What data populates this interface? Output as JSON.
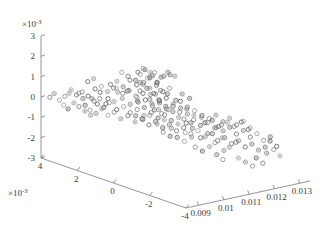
{
  "chart_data": {
    "type": "scatter",
    "title": "",
    "subtitle": "",
    "xlabel": "",
    "ylabel": "",
    "zlabel": "",
    "projection": "3d",
    "grid": false,
    "legend": null,
    "marker": {
      "shape": "circle",
      "filled": false,
      "size_px": 4.2,
      "edge_color": "#6e6e6e",
      "inner_dot_color": "#8c8c8c"
    },
    "axes": {
      "x": {
        "label": "",
        "exponent_label": "",
        "ticks": [
          0.009,
          0.01,
          0.011,
          0.012,
          0.013
        ],
        "tick_labels": [
          "0.009",
          "0.01",
          "0.011",
          "0.012",
          "0.013"
        ],
        "lim": [
          0.0085,
          0.0134
        ]
      },
      "y": {
        "label": "",
        "exponent_label": "×10",
        "exponent_value": "-3",
        "ticks": [
          4,
          2,
          0,
          -2,
          -4
        ],
        "tick_labels": [
          "4",
          "2",
          "0",
          "-2",
          "-4"
        ],
        "lim": [
          -4,
          4
        ],
        "scale_factor": 0.001
      },
      "z": {
        "label": "",
        "exponent_label": "×10",
        "exponent_value": "-3",
        "ticks": [
          3,
          2,
          1,
          0,
          -1,
          -2,
          -3
        ],
        "tick_labels": [
          "3",
          "2",
          "1",
          "0",
          "-1",
          "-2",
          "-3"
        ],
        "lim": [
          -3,
          3
        ],
        "scale_factor": 0.001
      }
    },
    "points": [
      [
        0.01058,
        1.42,
        0.95
      ],
      [
        0.01072,
        1.1,
        1.28
      ],
      [
        0.01085,
        0.88,
        1.05
      ],
      [
        0.01102,
        1.35,
        1.18
      ],
      [
        0.01118,
        0.62,
        1.4
      ],
      [
        0.01045,
        0.4,
        0.72
      ],
      [
        0.00996,
        1.8,
        0.52
      ],
      [
        0.01015,
        1.55,
        0.6
      ],
      [
        0.0103,
        1.22,
        0.35
      ],
      [
        0.01064,
        0.95,
        0.48
      ],
      [
        0.0108,
        0.7,
        0.25
      ],
      [
        0.01095,
        0.45,
        0.58
      ],
      [
        0.0111,
        0.2,
        0.3
      ],
      [
        0.01125,
        0.05,
        0.62
      ],
      [
        0.0114,
        -0.15,
        0.42
      ],
      [
        0.00962,
        2.3,
        0.45
      ],
      [
        0.00975,
        2.05,
        0.18
      ],
      [
        0.00988,
        1.9,
        0.05
      ],
      [
        0.01005,
        1.68,
        0.22
      ],
      [
        0.01022,
        1.48,
        -0.05
      ],
      [
        0.01038,
        1.3,
        0.12
      ],
      [
        0.01052,
        1.12,
        -0.18
      ],
      [
        0.01068,
        0.92,
        0.02
      ],
      [
        0.01082,
        0.75,
        -0.25
      ],
      [
        0.01098,
        0.58,
        -0.08
      ],
      [
        0.01112,
        0.38,
        -0.32
      ],
      [
        0.01128,
        0.18,
        -0.12
      ],
      [
        0.01142,
        0.0,
        -0.4
      ],
      [
        0.01155,
        -0.22,
        -0.2
      ],
      [
        0.01168,
        -0.42,
        -0.5
      ],
      [
        0.00948,
        2.55,
        0.1
      ],
      [
        0.00958,
        2.4,
        -0.15
      ],
      [
        0.0097,
        2.22,
        -0.3
      ],
      [
        0.00982,
        2.08,
        -0.05
      ],
      [
        0.00995,
        1.85,
        -0.35
      ],
      [
        0.01008,
        1.65,
        -0.18
      ],
      [
        0.0102,
        1.45,
        -0.45
      ],
      [
        0.01035,
        1.28,
        -0.28
      ],
      [
        0.01048,
        1.08,
        -0.55
      ],
      [
        0.01062,
        0.88,
        -0.38
      ],
      [
        0.01075,
        0.68,
        -0.62
      ],
      [
        0.01088,
        0.5,
        -0.45
      ],
      [
        0.011,
        0.3,
        -0.7
      ],
      [
        0.01115,
        0.1,
        -0.52
      ],
      [
        0.0113,
        -0.1,
        -0.78
      ],
      [
        0.01145,
        -0.3,
        -0.6
      ],
      [
        0.01158,
        -0.5,
        -0.85
      ],
      [
        0.01172,
        -0.7,
        -0.68
      ],
      [
        0.01185,
        -0.9,
        -0.92
      ],
      [
        0.01198,
        -1.1,
        -0.75
      ],
      [
        0.00935,
        2.75,
        -0.25
      ],
      [
        0.00945,
        2.62,
        -0.48
      ],
      [
        0.00956,
        2.45,
        -0.62
      ],
      [
        0.00968,
        2.3,
        -0.38
      ],
      [
        0.0098,
        2.12,
        -0.68
      ],
      [
        0.00992,
        1.95,
        -0.5
      ],
      [
        0.01004,
        1.75,
        -0.8
      ],
      [
        0.01018,
        1.55,
        -0.62
      ],
      [
        0.01032,
        1.35,
        -0.9
      ],
      [
        0.01045,
        1.15,
        -0.72
      ],
      [
        0.01058,
        0.95,
        -1.0
      ],
      [
        0.01072,
        0.78,
        -0.82
      ],
      [
        0.01086,
        0.58,
        -1.1
      ],
      [
        0.01098,
        0.38,
        -0.92
      ],
      [
        0.01112,
        0.18,
        -1.2
      ],
      [
        0.01126,
        -0.02,
        -1.02
      ],
      [
        0.0114,
        -0.22,
        -1.3
      ],
      [
        0.01154,
        -0.42,
        -1.12
      ],
      [
        0.01168,
        -0.62,
        -1.4
      ],
      [
        0.01182,
        -0.82,
        -1.22
      ],
      [
        0.01055,
        1.58,
        0.78
      ],
      [
        0.01068,
        1.38,
        0.92
      ],
      [
        0.01078,
        1.18,
        0.68
      ],
      [
        0.0109,
        0.98,
        0.85
      ],
      [
        0.01104,
        0.82,
        0.55
      ],
      [
        0.01116,
        0.62,
        0.75
      ],
      [
        0.01002,
        1.98,
        0.65
      ],
      [
        0.01014,
        1.78,
        0.42
      ],
      [
        0.01026,
        1.6,
        0.58
      ],
      [
        0.0104,
        1.42,
        0.32
      ],
      [
        0.01054,
        1.22,
        0.48
      ],
      [
        0.01066,
        1.02,
        0.22
      ],
      [
        0.00922,
        2.92,
        0.32
      ],
      [
        0.0093,
        2.8,
        0.08
      ],
      [
        0.0094,
        2.65,
        0.22
      ],
      [
        0.00952,
        2.5,
        -0.02
      ],
      [
        0.00964,
        2.35,
        0.12
      ],
      [
        0.00976,
        2.18,
        -0.12
      ],
      [
        0.01188,
        -1.02,
        -1.52
      ],
      [
        0.01202,
        -1.22,
        -1.35
      ],
      [
        0.01215,
        -1.42,
        -1.62
      ],
      [
        0.01228,
        -1.62,
        -1.45
      ],
      [
        0.0124,
        -1.82,
        -1.72
      ],
      [
        0.01252,
        -2.02,
        -1.55
      ],
      [
        0.01264,
        -2.22,
        -1.82
      ],
      [
        0.01276,
        -2.42,
        -1.65
      ],
      [
        0.01195,
        -0.85,
        -0.95
      ],
      [
        0.01208,
        -1.05,
        -1.08
      ],
      [
        0.0122,
        -1.25,
        -0.88
      ],
      [
        0.01232,
        -1.45,
        -1.18
      ],
      [
        0.01245,
        -1.65,
        -0.98
      ],
      [
        0.01258,
        -1.85,
        -1.28
      ],
      [
        0.0127,
        -2.05,
        -1.08
      ],
      [
        0.01282,
        -2.25,
        -1.38
      ],
      [
        0.01294,
        -2.45,
        -1.18
      ],
      [
        0.0116,
        -0.55,
        -0.35
      ],
      [
        0.01174,
        -0.75,
        -0.48
      ],
      [
        0.01186,
        -0.95,
        -0.28
      ],
      [
        0.012,
        -1.15,
        -0.58
      ],
      [
        0.01212,
        -1.35,
        -0.38
      ],
      [
        0.01225,
        -1.55,
        -0.68
      ],
      [
        0.01238,
        -1.75,
        -0.48
      ],
      [
        0.0125,
        -1.95,
        -0.78
      ],
      [
        0.01062,
        1.48,
        1.32
      ],
      [
        0.01076,
        1.28,
        1.15
      ],
      [
        0.01089,
        1.08,
        1.45
      ],
      [
        0.01101,
        0.88,
        1.25
      ],
      [
        0.01114,
        0.68,
        1.52
      ],
      [
        0.01127,
        0.48,
        1.35
      ],
      [
        0.00905,
        3.1,
        0.48
      ],
      [
        0.00915,
        2.95,
        0.25
      ],
      [
        0.00928,
        2.82,
        0.4
      ],
      [
        0.0089,
        3.25,
        0.15
      ],
      [
        0.00898,
        3.12,
        0.32
      ],
      [
        0.01042,
        1.32,
        0.05
      ],
      [
        0.01056,
        1.12,
        0.18
      ],
      [
        0.0107,
        0.92,
        -0.08
      ],
      [
        0.01084,
        0.72,
        0.08
      ],
      [
        0.01096,
        0.52,
        -0.18
      ],
      [
        0.01108,
        0.32,
        -0.02
      ],
      [
        0.0112,
        0.12,
        -0.28
      ],
      [
        0.01134,
        -0.08,
        -0.1
      ],
      [
        0.01148,
        -0.28,
        -0.38
      ],
      [
        0.0088,
        3.4,
        -0.05
      ],
      [
        0.00888,
        3.28,
        -0.28
      ],
      [
        0.00896,
        3.15,
        -0.45
      ],
      [
        0.01036,
        1.38,
        -0.62
      ],
      [
        0.0105,
        1.18,
        -0.78
      ],
      [
        0.01064,
        0.98,
        -0.55
      ],
      [
        0.01078,
        0.78,
        -0.95
      ],
      [
        0.01092,
        0.58,
        -0.72
      ],
      [
        0.01106,
        0.38,
        -1.12
      ],
      [
        0.01118,
        0.18,
        -0.88
      ],
      [
        0.01132,
        -0.02,
        -1.28
      ],
      [
        0.01146,
        -0.22,
        -1.05
      ],
      [
        0.01162,
        -0.45,
        -1.48
      ],
      [
        0.01176,
        -0.65,
        -1.25
      ],
      [
        0.0119,
        -0.85,
        -1.68
      ],
      [
        0.01204,
        -1.05,
        -1.42
      ],
      [
        0.01218,
        -1.25,
        -1.85
      ],
      [
        0.0123,
        -1.45,
        -1.58
      ],
      [
        0.0087,
        3.55,
        0.25
      ],
      [
        0.00862,
        3.68,
        0.05
      ],
      [
        0.01046,
        1.52,
        1.05
      ],
      [
        0.0106,
        1.32,
        0.88
      ],
      [
        0.01074,
        1.12,
        1.22
      ],
      [
        0.01088,
        0.92,
        0.98
      ],
      [
        0.011,
        0.72,
        1.35
      ],
      [
        0.00985,
        2.05,
        0.85
      ],
      [
        0.00998,
        1.88,
        1.02
      ],
      [
        0.0101,
        1.7,
        0.78
      ],
      [
        0.01024,
        1.52,
        1.12
      ],
      [
        0.01038,
        1.34,
        0.92
      ],
      [
        0.0115,
        -0.32,
        -1.95
      ],
      [
        0.01164,
        -0.52,
        -2.12
      ],
      [
        0.01178,
        -0.72,
        -1.88
      ],
      [
        0.01192,
        -0.92,
        -2.25
      ],
      [
        0.01206,
        -1.12,
        -2.02
      ],
      [
        0.01285,
        -2.38,
        -1.98
      ],
      [
        0.01298,
        -2.58,
        -1.78
      ],
      [
        0.01308,
        -2.78,
        -2.05
      ],
      [
        0.0126,
        -2.15,
        -2.22
      ],
      [
        0.01272,
        -2.35,
        -2.45
      ],
      [
        0.00955,
        2.48,
        0.58
      ],
      [
        0.00968,
        2.32,
        0.72
      ],
      [
        0.0098,
        2.15,
        0.48
      ],
      [
        0.00992,
        1.98,
        0.68
      ],
      [
        0.01092,
        0.85,
        0.12
      ],
      [
        0.01105,
        0.65,
        0.28
      ],
      [
        0.01118,
        0.45,
        0.02
      ],
      [
        0.01132,
        0.25,
        0.18
      ],
      [
        0.01145,
        0.05,
        -0.08
      ],
      [
        0.01215,
        -1.18,
        -0.65
      ],
      [
        0.01228,
        -1.38,
        -0.82
      ],
      [
        0.01242,
        -1.58,
        -0.58
      ],
      [
        0.01255,
        -1.78,
        -0.92
      ],
      [
        0.01044,
        1.25,
        0.62
      ],
      [
        0.01057,
        1.05,
        0.78
      ],
      [
        0.0107,
        0.85,
        0.55
      ],
      [
        0.01083,
        0.65,
        0.72
      ],
      [
        0.0091,
        3.02,
        -0.15
      ],
      [
        0.0092,
        2.88,
        -0.32
      ],
      [
        0.00932,
        2.72,
        -0.52
      ],
      [
        0.00944,
        2.58,
        -0.72
      ],
      [
        0.01122,
        0.28,
        -1.58
      ],
      [
        0.01136,
        0.08,
        -1.75
      ],
      [
        0.0115,
        -0.12,
        -1.52
      ],
      [
        0.01095,
        0.68,
        -1.38
      ],
      [
        0.01108,
        0.48,
        -1.55
      ],
      [
        0.01288,
        -2.52,
        -1.35
      ],
      [
        0.013,
        -2.72,
        -1.58
      ],
      [
        0.01048,
        1.42,
        1.48
      ],
      [
        0.01062,
        1.22,
        1.62
      ],
      [
        0.01075,
        1.02,
        1.38
      ],
      [
        0.01028,
        1.68,
        1.25
      ],
      [
        0.01015,
        1.85,
        1.42
      ],
      [
        0.0117,
        -0.58,
        -0.72
      ],
      [
        0.01184,
        -0.78,
        -0.58
      ],
      [
        0.01196,
        -0.98,
        -0.85
      ],
      [
        0.0108,
        0.95,
        -0.32
      ],
      [
        0.01094,
        0.75,
        -0.48
      ],
      [
        0.01107,
        0.55,
        -0.25
      ],
      [
        0.0094,
        2.68,
        0.92
      ],
      [
        0.00952,
        2.52,
        1.08
      ],
      [
        0.01235,
        -1.52,
        -2.35
      ],
      [
        0.01248,
        -1.72,
        -2.52
      ],
      [
        0.0113,
        0.02,
        -0.62
      ],
      [
        0.01143,
        -0.18,
        -0.78
      ],
      [
        0.01052,
        1.18,
        1.72
      ],
      [
        0.01066,
        0.98,
        1.55
      ],
      [
        0.0126,
        -1.95,
        -2.68
      ],
      [
        0.01205,
        -1.08,
        -2.48
      ]
    ]
  }
}
